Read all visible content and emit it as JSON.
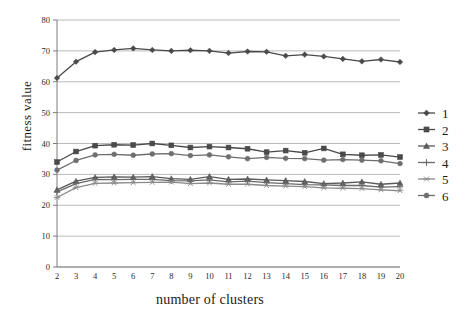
{
  "chart_data": {
    "type": "line",
    "title": "",
    "xlabel": "number of clusters",
    "ylabel": "fitness  value",
    "xlim": [
      2,
      20
    ],
    "ylim": [
      0,
      80
    ],
    "ytick_labels": [
      "0",
      "10",
      "20",
      "30",
      "40",
      "50",
      "60",
      "70",
      "80"
    ],
    "yticks": [
      0,
      10,
      20,
      30,
      40,
      50,
      60,
      70,
      80
    ],
    "grid": true,
    "legend_position": "right",
    "x": [
      2,
      3,
      4,
      5,
      6,
      7,
      8,
      9,
      10,
      11,
      12,
      13,
      14,
      15,
      16,
      17,
      18,
      19,
      20
    ],
    "xtick_labels": [
      "2",
      "3",
      "4",
      "5",
      "6",
      "7",
      "8",
      "9",
      "10",
      "11",
      "12",
      "13",
      "14",
      "15",
      "16",
      "17",
      "18",
      "19",
      "20"
    ],
    "series": [
      {
        "name": "1",
        "marker": "diamond",
        "color": "#4a4a4a",
        "values": [
          61.2,
          66.5,
          69.6,
          70.3,
          70.8,
          70.3,
          70.0,
          70.2,
          70.0,
          69.3,
          69.8,
          69.7,
          68.4,
          68.8,
          68.2,
          67.4,
          66.6,
          67.2,
          66.4
        ]
      },
      {
        "name": "2",
        "marker": "square",
        "color": "#4a4a4a",
        "values": [
          34.0,
          37.4,
          39.3,
          39.6,
          39.5,
          40.0,
          39.4,
          38.7,
          39.0,
          38.7,
          38.3,
          37.2,
          37.7,
          37.0,
          38.4,
          36.5,
          36.2,
          36.3,
          35.6
        ]
      },
      {
        "name": "3",
        "marker": "triangle",
        "color": "#5a5a5a",
        "values": [
          25.0,
          27.8,
          29.0,
          29.2,
          29.1,
          29.3,
          28.6,
          28.4,
          29.3,
          28.4,
          28.5,
          28.2,
          28.0,
          27.7,
          27.0,
          27.2,
          27.6,
          26.8,
          27.2
        ]
      },
      {
        "name": "4",
        "marker": "cross",
        "color": "#6a6a6a",
        "values": [
          24.3,
          27.0,
          28.4,
          28.3,
          28.4,
          28.4,
          28.0,
          27.9,
          28.2,
          27.6,
          27.8,
          27.3,
          27.0,
          26.7,
          26.6,
          26.4,
          26.4,
          25.9,
          26.0
        ]
      },
      {
        "name": "5",
        "marker": "asterisk",
        "color": "#8a8a8a",
        "values": [
          22.5,
          25.7,
          27.1,
          27.2,
          27.3,
          27.4,
          27.5,
          27.0,
          27.2,
          26.8,
          26.8,
          26.4,
          26.2,
          26.0,
          25.6,
          25.5,
          25.4,
          25.0,
          24.7
        ]
      },
      {
        "name": "6",
        "marker": "circle",
        "color": "#6e6e6e",
        "values": [
          31.4,
          34.5,
          36.3,
          36.5,
          36.2,
          36.6,
          36.7,
          36.1,
          36.3,
          35.7,
          35.1,
          35.5,
          35.2,
          35.1,
          34.6,
          34.8,
          34.6,
          34.4,
          33.5
        ]
      }
    ]
  },
  "legend": {
    "items": [
      {
        "label": "1",
        "marker": "diamond"
      },
      {
        "label": "2",
        "marker": "square"
      },
      {
        "label": "3",
        "marker": "triangle"
      },
      {
        "label": "4",
        "marker": "cross"
      },
      {
        "label": "5",
        "marker": "asterisk"
      },
      {
        "label": "6",
        "marker": "circle"
      }
    ]
  }
}
